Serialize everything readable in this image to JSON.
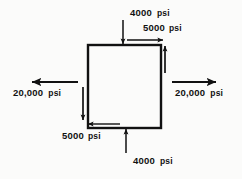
{
  "figure": {
    "type": "stress-element-diagram",
    "colors": {
      "stroke": "#111111",
      "background": "#fbfbfa",
      "text": "#111111"
    },
    "element": {
      "name": "square-element",
      "x": 88,
      "y": 45,
      "width": 73,
      "height": 83,
      "stroke_width": 2.4
    },
    "stresses": {
      "normal_top": {
        "value": "4000",
        "unit": "psi",
        "direction": "down",
        "kind": "normal-compressive-top"
      },
      "normal_bottom": {
        "value": "4000",
        "unit": "psi",
        "direction": "up",
        "kind": "normal-compressive-bottom"
      },
      "normal_left": {
        "value": "20,000",
        "unit": "psi",
        "direction": "left",
        "kind": "normal-tensile-left"
      },
      "normal_right": {
        "value": "20,000",
        "unit": "psi",
        "direction": "right",
        "kind": "normal-tensile-right"
      },
      "shear_top": {
        "value": "5000",
        "unit": "psi",
        "direction": "right",
        "kind": "shear-top"
      },
      "shear_bottom": {
        "value": "5000",
        "unit": "psi",
        "direction": "left",
        "kind": "shear-bottom"
      },
      "shear_right": {
        "value": "5000",
        "unit": "psi",
        "direction": "up",
        "kind": "shear-right-unlabeled"
      },
      "shear_left": {
        "value": "5000",
        "unit": "psi",
        "direction": "down",
        "kind": "shear-left-unlabeled"
      }
    }
  }
}
